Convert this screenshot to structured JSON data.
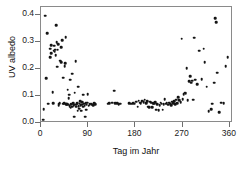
{
  "chart_data": {
    "type": "scatter",
    "title": "",
    "xlabel": "Tag im Jahr",
    "ylabel": "UV albedo",
    "xlim": [
      0,
      366
    ],
    "ylim": [
      0.0,
      0.43
    ],
    "grid": false,
    "legend": null,
    "marker": "filled-circle",
    "marker_color": "#141414",
    "xticks": [
      0,
      90,
      180,
      270,
      360
    ],
    "xticklabels": [
      "0",
      "90",
      "180",
      "270",
      "360"
    ],
    "yticks": [
      0.0,
      0.1,
      0.2,
      0.3,
      0.4
    ],
    "yticklabels": [
      "0.0",
      "0.1",
      "0.2",
      "0.3",
      "0.4"
    ],
    "series": [
      {
        "name": "UV albedo",
        "points": [
          [
            4,
            0.012
          ],
          [
            5,
            0.051
          ],
          [
            8,
            0.397
          ],
          [
            10,
            0.166
          ],
          [
            12,
            0.333
          ],
          [
            14,
            0.072
          ],
          [
            17,
            0.243
          ],
          [
            18,
            0.276
          ],
          [
            19,
            0.289
          ],
          [
            20,
            0.258
          ],
          [
            22,
            0.115
          ],
          [
            23,
            0.073
          ],
          [
            24,
            0.268
          ],
          [
            25,
            0.287
          ],
          [
            26,
            0.265
          ],
          [
            27,
            0.271
          ],
          [
            28,
            0.252
          ],
          [
            29,
            0.363
          ],
          [
            30,
            0.3
          ],
          [
            31,
            0.208
          ],
          [
            32,
            0.272
          ],
          [
            33,
            0.293
          ],
          [
            34,
            0.066
          ],
          [
            35,
            0.071
          ],
          [
            36,
            0.075
          ],
          [
            37,
            0.231
          ],
          [
            38,
            0.226
          ],
          [
            39,
            0.282
          ],
          [
            40,
            0.306
          ],
          [
            41,
            0.071
          ],
          [
            42,
            0.168
          ],
          [
            43,
            0.071
          ],
          [
            44,
            0.073
          ],
          [
            45,
            0.211
          ],
          [
            46,
            0.222
          ],
          [
            47,
            0.318
          ],
          [
            48,
            0.07
          ],
          [
            49,
            0.069
          ],
          [
            50,
            0.072
          ],
          [
            51,
            0.124
          ],
          [
            52,
            0.068
          ],
          [
            53,
            0.091
          ],
          [
            54,
            0.105
          ],
          [
            55,
            0.063
          ],
          [
            56,
            0.16
          ],
          [
            57,
            0.057
          ],
          [
            58,
            0.07
          ],
          [
            59,
            0.061
          ],
          [
            60,
            0.182
          ],
          [
            61,
            0.073
          ],
          [
            62,
            0.066
          ],
          [
            63,
            0.023
          ],
          [
            64,
            0.112
          ],
          [
            65,
            0.068
          ],
          [
            66,
            0.229
          ],
          [
            67,
            0.06
          ],
          [
            68,
            0.07
          ],
          [
            69,
            0.073
          ],
          [
            70,
            0.046
          ],
          [
            71,
            0.135
          ],
          [
            72,
            0.063
          ],
          [
            73,
            0.053
          ],
          [
            74,
            0.071
          ],
          [
            75,
            0.08
          ],
          [
            76,
            0.066
          ],
          [
            77,
            0.045
          ],
          [
            78,
            0.068
          ],
          [
            79,
            0.077
          ],
          [
            80,
            0.06
          ],
          [
            81,
            0.105
          ],
          [
            82,
            0.071
          ],
          [
            83,
            0.064
          ],
          [
            84,
            0.024
          ],
          [
            85,
            0.073
          ],
          [
            86,
            0.05
          ],
          [
            87,
            0.068
          ],
          [
            88,
            0.075
          ],
          [
            89,
            0.107
          ],
          [
            91,
            0.064
          ],
          [
            93,
            0.069
          ],
          [
            95,
            0.071
          ],
          [
            97,
            0.07
          ],
          [
            99,
            0.066
          ],
          [
            101,
            0.074
          ],
          [
            103,
            0.07
          ],
          [
            127,
            0.072
          ],
          [
            130,
            0.073
          ],
          [
            136,
            0.076
          ],
          [
            139,
            0.12
          ],
          [
            142,
            0.074
          ],
          [
            145,
            0.073
          ],
          [
            148,
            0.07
          ],
          [
            151,
            0.072
          ],
          [
            168,
            0.073
          ],
          [
            172,
            0.072
          ],
          [
            176,
            0.074
          ],
          [
            179,
            0.071
          ],
          [
            182,
            0.079
          ],
          [
            184,
            0.06
          ],
          [
            186,
            0.082
          ],
          [
            188,
            0.076
          ],
          [
            190,
            0.074
          ],
          [
            192,
            0.081
          ],
          [
            194,
            0.083
          ],
          [
            196,
            0.078
          ],
          [
            198,
            0.086
          ],
          [
            200,
            0.073
          ],
          [
            202,
            0.08
          ],
          [
            204,
            0.06
          ],
          [
            206,
            0.058
          ],
          [
            208,
            0.079
          ],
          [
            210,
            0.076
          ],
          [
            212,
            0.059
          ],
          [
            214,
            0.074
          ],
          [
            216,
            0.072
          ],
          [
            218,
            0.077
          ],
          [
            220,
            0.05
          ],
          [
            222,
            0.07
          ],
          [
            224,
            0.048
          ],
          [
            226,
            0.066
          ],
          [
            228,
            0.075
          ],
          [
            230,
            0.072
          ],
          [
            232,
            0.049
          ],
          [
            234,
            0.069
          ],
          [
            236,
            0.088
          ],
          [
            238,
            0.071
          ],
          [
            240,
            0.074
          ],
          [
            242,
            0.068
          ],
          [
            244,
            0.076
          ],
          [
            246,
            0.071
          ],
          [
            248,
            0.065
          ],
          [
            250,
            0.079
          ],
          [
            252,
            0.073
          ],
          [
            254,
            0.081
          ],
          [
            256,
            0.069
          ],
          [
            258,
            0.086
          ],
          [
            260,
            0.074
          ],
          [
            262,
            0.096
          ],
          [
            264,
            0.085
          ],
          [
            266,
            0.078
          ],
          [
            268,
            0.313
          ],
          [
            270,
            0.089
          ],
          [
            272,
            0.107
          ],
          [
            274,
            0.113
          ],
          [
            276,
            0.111
          ],
          [
            278,
            0.203
          ],
          [
            280,
            0.085
          ],
          [
            282,
            0.155
          ],
          [
            284,
            0.174
          ],
          [
            286,
            0.149
          ],
          [
            288,
            0.157
          ],
          [
            290,
            0.086
          ],
          [
            292,
            0.316
          ],
          [
            294,
            0.16
          ],
          [
            298,
            0.143
          ],
          [
            302,
            0.268
          ],
          [
            306,
            0.163
          ],
          [
            310,
            0.275
          ],
          [
            312,
            0.226
          ],
          [
            316,
            0.135
          ],
          [
            320,
            0.043
          ],
          [
            324,
            0.051
          ],
          [
            326,
            0.072
          ],
          [
            330,
            0.15
          ],
          [
            332,
            0.388
          ],
          [
            334,
            0.374
          ],
          [
            336,
            0.186
          ],
          [
            340,
            0.041
          ],
          [
            344,
            0.076
          ],
          [
            348,
            0.073
          ],
          [
            352,
            0.211
          ],
          [
            356,
            0.245
          ]
        ]
      }
    ]
  }
}
